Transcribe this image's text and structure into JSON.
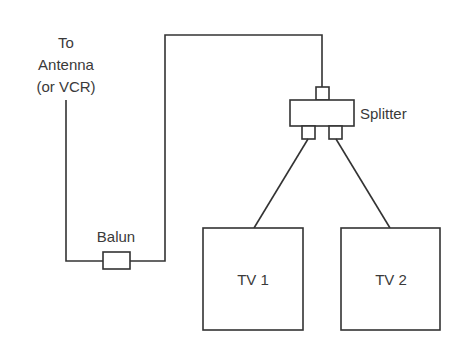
{
  "diagram": {
    "type": "wiring",
    "labels": {
      "antenna_line1": "To",
      "antenna_line2": "Antenna",
      "antenna_line3": "(or VCR)",
      "splitter": "Splitter",
      "balun": "Balun",
      "tv1": "TV 1",
      "tv2": "TV 2"
    },
    "nodes": [
      {
        "id": "antenna",
        "label": "To Antenna (or VCR)"
      },
      {
        "id": "balun",
        "label": "Balun"
      },
      {
        "id": "splitter",
        "label": "Splitter"
      },
      {
        "id": "tv1",
        "label": "TV 1"
      },
      {
        "id": "tv2",
        "label": "TV 2"
      }
    ],
    "edges": [
      {
        "from": "antenna",
        "to": "balun"
      },
      {
        "from": "balun",
        "to": "splitter"
      },
      {
        "from": "splitter",
        "to": "tv1"
      },
      {
        "from": "splitter",
        "to": "tv2"
      }
    ],
    "colors": {
      "line": "#333333",
      "text": "#3a3a3a",
      "background": "#ffffff"
    }
  }
}
